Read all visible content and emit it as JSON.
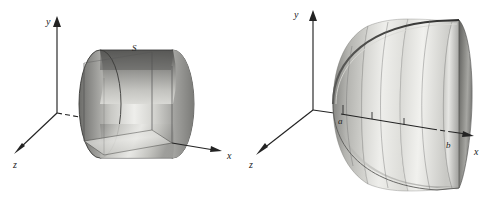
{
  "figure": {
    "background_color": "#ffffff",
    "ink_color": "#232323",
    "panels": [
      {
        "id": "left-panel",
        "name": "cylinder-about-x-axis",
        "description": "Right circular cylinder whose axis lies along the x-axis, with an inscribed rectangular cross-section box drawn in the xz plane",
        "axes": {
          "y": {
            "label": "y",
            "label_x": 49,
            "label_y": 22,
            "from": [
              57,
              113
            ],
            "to": [
              57,
              17
            ],
            "arrow": "up"
          },
          "x": {
            "label": "x",
            "label_x": 229,
            "label_y": 156,
            "from": [
              57,
              113
            ],
            "to": [
              222,
              144
            ],
            "arrow": "right"
          },
          "z": {
            "label": "z",
            "label_x": 13,
            "label_y": 166,
            "from": [
              57,
              113
            ],
            "to": [
              14,
              152
            ],
            "arrow": "down-left"
          }
        },
        "surface_label": {
          "text": "S",
          "x": 134,
          "y": 49
        }
      },
      {
        "id": "right-panel",
        "name": "solid-of-revolution-a-to-b",
        "description": "Solid of revolution generated about the x-axis between the planes x = a and x = b, drawn with meridian ribs and tick marks on the x-axis",
        "axes": {
          "y": {
            "label": "y",
            "label_x": 296,
            "label_y": 14,
            "from": [
              313,
              110
            ],
            "to": [
              313,
              11
            ],
            "arrow": "up"
          },
          "x": {
            "label": "x",
            "label_x": 476,
            "label_y": 153,
            "from": [
              313,
              110
            ],
            "to": [
              472,
              136
            ],
            "arrow": "right"
          },
          "z": {
            "label": "z",
            "label_x": 250,
            "label_y": 166,
            "from": [
              313,
              110
            ],
            "to": [
              257,
              153
            ],
            "arrow": "down-left"
          }
        },
        "bounds": [
          {
            "text": "a",
            "x": 340,
            "y": 117,
            "tick_x": 343,
            "tick_y": 104
          },
          {
            "text": "b",
            "x": 447,
            "y": 145,
            "tick_x": 448,
            "tick_y": 131
          }
        ],
        "interior_ticks": [
          {
            "x": 372,
            "y": 110
          },
          {
            "x": 404,
            "y": 116
          }
        ]
      }
    ],
    "shading": {
      "light_gray": "#f2f2f0",
      "mid_gray": "#b9b9b5",
      "dark_gray": "#6e6e6b",
      "deep_gray": "#4a4a48",
      "outline_gray": "#3a3a3a"
    }
  }
}
